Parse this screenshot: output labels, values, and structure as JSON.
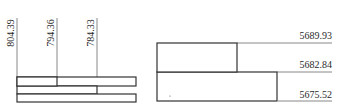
{
  "left_diagram": {
    "title": "",
    "orientation": "vertical-labels",
    "levels": [
      {
        "label": "804.39"
      },
      {
        "label": "794.36"
      },
      {
        "label": "784.33"
      }
    ]
  },
  "right_diagram": {
    "title": "",
    "orientation": "horizontal-labels",
    "levels": [
      {
        "label": "5689.93"
      },
      {
        "label": "5682.84"
      },
      {
        "label": "5675.52"
      }
    ]
  },
  "colors": {
    "outline": "#333333",
    "leader": "#888888",
    "text": "#2a2a2a"
  }
}
